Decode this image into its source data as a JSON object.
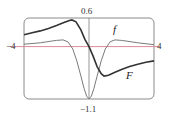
{
  "chart_data": {
    "type": "line",
    "title": "",
    "xlabel": "",
    "ylabel": "",
    "xlim": [
      -4,
      4
    ],
    "ylim": [
      -1.1,
      0.6
    ],
    "grid": false,
    "legend": "inline curve labels",
    "tick_labels": {
      "x_left": "−4",
      "x_right": "4",
      "y_top": "0.6",
      "y_bottom": "−1.1"
    },
    "series": [
      {
        "name": "f",
        "label": "f",
        "color": "#7a7a7a",
        "x": [
          -4,
          -3,
          -2.4,
          -2,
          -1.6,
          -1.3,
          -1,
          -0.75,
          -0.5,
          -0.3,
          -0.15,
          0,
          0.15,
          0.3,
          0.5,
          0.75,
          1,
          1.3,
          1.6,
          2,
          2.4,
          3,
          4
        ],
        "y": [
          0.05,
          0.08,
          0.11,
          0.13,
          0.14,
          0.1,
          -0.05,
          -0.3,
          -0.62,
          -0.88,
          -1.04,
          -1.1,
          -1.04,
          -0.88,
          -0.62,
          -0.3,
          -0.05,
          0.1,
          0.14,
          0.13,
          0.11,
          0.08,
          0.04
        ]
      },
      {
        "name": "F",
        "label": "F",
        "color": "#333333",
        "x": [
          -4,
          -3.5,
          -3,
          -2.5,
          -2,
          -1.5,
          -1.2,
          -1.05,
          -0.8,
          -0.5,
          -0.25,
          0,
          0.25,
          0.5,
          0.75,
          0.92,
          1.2,
          1.6,
          2,
          2.5,
          3,
          3.5,
          4
        ],
        "y": [
          0.25,
          0.29,
          0.33,
          0.38,
          0.44,
          0.51,
          0.55,
          0.56,
          0.52,
          0.35,
          0.15,
          0.0,
          -0.2,
          -0.42,
          -0.57,
          -0.62,
          -0.6,
          -0.54,
          -0.48,
          -0.42,
          -0.37,
          -0.33,
          -0.3
        ]
      }
    ],
    "annotations": [
      {
        "text": "f",
        "x": 1.6,
        "y": 0.32
      },
      {
        "text": "F",
        "x": 2.5,
        "y": -0.66
      }
    ]
  },
  "colors": {
    "frame": "#8a8a8a",
    "x_axis": "#d98a9b",
    "y_axis": "#8a8a8a"
  }
}
